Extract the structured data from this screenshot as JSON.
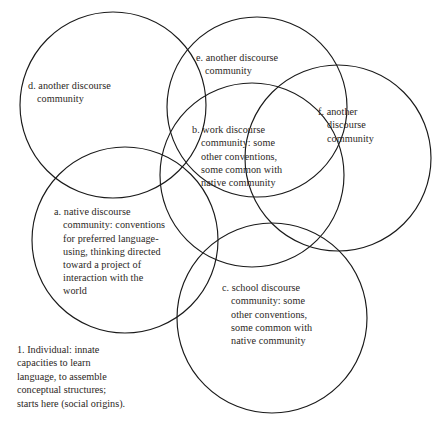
{
  "diagram": {
    "type": "venn",
    "stroke_color": "#1a1a1a",
    "background_color": "#ffffff",
    "text_color": "#2b2724",
    "circles": [
      {
        "key": "d",
        "marker": "d.",
        "text": "d. another discourse\ncommunity",
        "cx": 113,
        "cy": 105,
        "r": 93
      },
      {
        "key": "e",
        "marker": "e.",
        "text": "e. another discourse\n    community",
        "cx": 257,
        "cy": 107,
        "r": 90
      },
      {
        "key": "f",
        "marker": "f.",
        "text": "f.  another\n    discourse\n    community",
        "cx": 338,
        "cy": 158,
        "r": 93
      },
      {
        "key": "b",
        "marker": "b.",
        "text": "b. work discourse\n    community: some\n    other conventions,\n    some common with\n    native community",
        "cx": 252,
        "cy": 175,
        "r": 92
      },
      {
        "key": "a",
        "marker": "a.",
        "text": "a. native discourse\n    community: conventions\n    for preferred language-\n    using, thinking directed\n    toward a project of\n    interaction with the\n    world",
        "cx": 125,
        "cy": 240,
        "r": 93
      },
      {
        "key": "c",
        "marker": "c.",
        "text": "c. school discourse\n    community: some\n    other conventions,\n    some common with\n    native community",
        "cx": 272,
        "cy": 318,
        "r": 95
      }
    ],
    "caption": {
      "key": "1",
      "text": "1. Individual: innate\ncapacities to learn\nlanguage, to assemble\nconceptual structures;\nstarts here (social origins)."
    }
  }
}
